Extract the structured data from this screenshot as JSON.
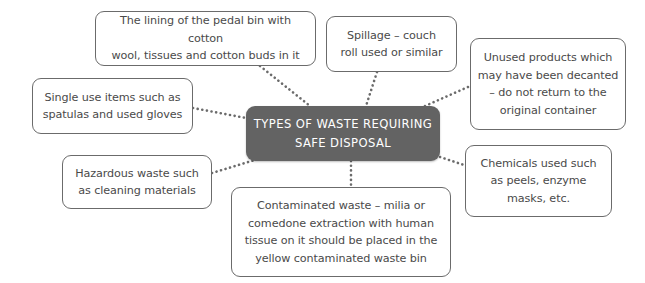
{
  "diagram": {
    "type": "mind-map",
    "colors": {
      "center_fill": "#636363",
      "center_text": "#ffffff",
      "node_border": "#6b6b6b",
      "node_text": "#4a4a4a",
      "connector": "#6b6b6b"
    },
    "center": {
      "title": "TYPES OF WASTE REQUIRING SAFE DISPOSAL",
      "line1": "TYPES OF WASTE REQUIRING",
      "line2": "SAFE DISPOSAL"
    },
    "nodes": [
      {
        "id": "lining",
        "text": "The lining of the pedal bin with cotton wool, tissues and cotton buds in it"
      },
      {
        "id": "spillage",
        "text": "Spillage – couch roll used or similar"
      },
      {
        "id": "unused",
        "text": "Unused products which may have been decanted – do not return to the original container"
      },
      {
        "id": "single-use",
        "text": "Single use items such as spatulas and used gloves"
      },
      {
        "id": "hazardous",
        "text": "Hazardous waste such as cleaning materials"
      },
      {
        "id": "chemicals",
        "text": "Chemicals used such as peels, enzyme masks, etc."
      },
      {
        "id": "contaminated",
        "text": "Contaminated waste – milia or comedone extraction with human tissue on it should be placed in the yellow contaminated waste bin"
      }
    ],
    "lines": {
      "lining": [
        "The lining of the pedal bin with cotton",
        "wool, tissues and cotton buds in it"
      ],
      "spillage": [
        "Spillage – couch",
        "roll used or similar"
      ],
      "unused": [
        "Unused products which",
        "may have been decanted",
        "– do not return to the",
        "original container"
      ],
      "single_use": [
        "Single use items such as",
        "spatulas and used gloves"
      ],
      "hazardous": [
        "Hazardous waste such",
        "as cleaning materials"
      ],
      "chemicals": [
        "Chemicals used such",
        "as peels, enzyme",
        "masks, etc."
      ],
      "contaminated": [
        "Contaminated waste – milia or",
        "comedone extraction with human",
        "tissue on it should be placed in the",
        "yellow contaminated waste bin"
      ]
    }
  }
}
